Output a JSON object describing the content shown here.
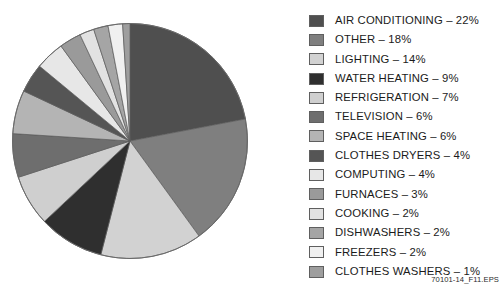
{
  "figure": {
    "id_label": "70101-14_F11.EPS"
  },
  "chart_data": {
    "type": "pie",
    "title": "",
    "xlabel": "",
    "ylabel": "",
    "units": "percent",
    "start_angle_deg": 0,
    "direction": "clockwise",
    "legend_position": "right",
    "grid": false,
    "total": 100,
    "categories": [
      "AIR CONDITIONING",
      "OTHER",
      "LIGHTING",
      "WATER HEATING",
      "REFRIGERATION",
      "TELEVISION",
      "SPACE HEATING",
      "CLOTHES DRYERS",
      "COMPUTING",
      "FURNACES",
      "COOKING",
      "DISHWASHERS",
      "FREEZERS",
      "CLOTHES WASHERS"
    ],
    "values": [
      22,
      18,
      14,
      9,
      7,
      6,
      6,
      4,
      4,
      3,
      2,
      2,
      2,
      1
    ],
    "colors": [
      "#4f4f4f",
      "#7f7f7f",
      "#d2d2d2",
      "#2f2f2f",
      "#cfcfcf",
      "#6e6e6e",
      "#b4b4b4",
      "#555555",
      "#e7e7e7",
      "#9a9a9a",
      "#e2e2e2",
      "#a5a5a5",
      "#f0f0f0",
      "#9e9e9e"
    ],
    "slices": [
      {
        "label": "AIR CONDITIONING",
        "value": 22,
        "color": "#4f4f4f"
      },
      {
        "label": "OTHER",
        "value": 18,
        "color": "#7f7f7f"
      },
      {
        "label": "LIGHTING",
        "value": 14,
        "color": "#d2d2d2"
      },
      {
        "label": "WATER HEATING",
        "value": 9,
        "color": "#2f2f2f"
      },
      {
        "label": "REFRIGERATION",
        "value": 7,
        "color": "#cfcfcf"
      },
      {
        "label": "TELEVISION",
        "value": 6,
        "color": "#6e6e6e"
      },
      {
        "label": "SPACE HEATING",
        "value": 6,
        "color": "#b4b4b4"
      },
      {
        "label": "CLOTHES DRYERS",
        "value": 4,
        "color": "#555555"
      },
      {
        "label": "COMPUTING",
        "value": 4,
        "color": "#e7e7e7"
      },
      {
        "label": "FURNACES",
        "value": 3,
        "color": "#9a9a9a"
      },
      {
        "label": "COOKING",
        "value": 2,
        "color": "#e2e2e2"
      },
      {
        "label": "DISHWASHERS",
        "value": 2,
        "color": "#a5a5a5"
      },
      {
        "label": "FREEZERS",
        "value": 2,
        "color": "#f0f0f0"
      },
      {
        "label": "CLOTHES WASHERS",
        "value": 1,
        "color": "#9e9e9e"
      }
    ]
  },
  "legend": {
    "items": [
      {
        "label": "AIR CONDITIONING – 22%",
        "color": "#4f4f4f"
      },
      {
        "label": "OTHER – 18%",
        "color": "#7f7f7f"
      },
      {
        "label": "LIGHTING – 14%",
        "color": "#d2d2d2"
      },
      {
        "label": "WATER HEATING – 9%",
        "color": "#2f2f2f"
      },
      {
        "label": "REFRIGERATION – 7%",
        "color": "#cfcfcf"
      },
      {
        "label": "TELEVISION – 6%",
        "color": "#6e6e6e"
      },
      {
        "label": "SPACE HEATING – 6%",
        "color": "#b4b4b4"
      },
      {
        "label": "CLOTHES DRYERS – 4%",
        "color": "#555555"
      },
      {
        "label": "COMPUTING – 4%",
        "color": "#e7e7e7"
      },
      {
        "label": "FURNACES – 3%",
        "color": "#9a9a9a"
      },
      {
        "label": "COOKING – 2%",
        "color": "#e2e2e2"
      },
      {
        "label": "DISHWASHERS – 2%",
        "color": "#a5a5a5"
      },
      {
        "label": "FREEZERS – 2%",
        "color": "#f0f0f0"
      },
      {
        "label": "CLOTHES WASHERS – 1%",
        "color": "#9e9e9e"
      }
    ]
  }
}
